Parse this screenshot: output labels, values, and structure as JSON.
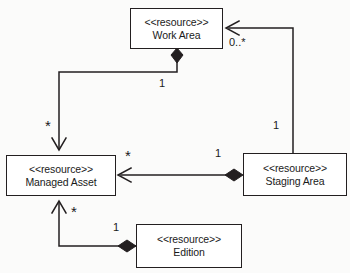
{
  "diagram": {
    "type": "uml-class-diagram",
    "background_color": "#fbfbfa",
    "line_color": "#231f20",
    "box_fill": "#ffffff",
    "classes": [
      {
        "id": "work-area",
        "stereotype": "<<resource>>",
        "name": "Work Area",
        "x": 130,
        "y": 8,
        "width": 93,
        "height": 41
      },
      {
        "id": "managed-asset",
        "stereotype": "<<resource>>",
        "name": "Managed Asset",
        "x": 6,
        "y": 155,
        "width": 110,
        "height": 41
      },
      {
        "id": "staging-area",
        "stereotype": "<<resource>>",
        "name": "Staging Area",
        "x": 243,
        "y": 153,
        "width": 104,
        "height": 43
      },
      {
        "id": "edition",
        "stereotype": "<<resource>>",
        "name": "Edition",
        "x": 136,
        "y": 224,
        "width": 106,
        "height": 44
      }
    ],
    "relationships": [
      {
        "id": "work-area-composes-managed-asset",
        "from": "work-area",
        "to": "managed-asset",
        "kind": "composition",
        "source_multiplicity": "1",
        "target_multiplicity": "*"
      },
      {
        "id": "staging-area-composes-managed-asset",
        "from": "staging-area",
        "to": "managed-asset",
        "kind": "composition",
        "source_multiplicity": "1",
        "target_multiplicity": "*"
      },
      {
        "id": "staging-area-references-work-area",
        "from": "staging-area",
        "to": "work-area",
        "kind": "association",
        "source_multiplicity": "1",
        "target_multiplicity": "0..*"
      },
      {
        "id": "edition-composes-managed-asset",
        "from": "edition",
        "to": "managed-asset",
        "kind": "composition",
        "source_multiplicity": "1",
        "target_multiplicity": "*"
      }
    ],
    "multiplicity_labels": [
      {
        "id": "work-area-end",
        "text": "1",
        "x": 159,
        "y": 78,
        "star": false
      },
      {
        "id": "work-area-target",
        "text": "*",
        "x": 45,
        "y": 118,
        "star": true
      },
      {
        "id": "staging-to-work-area",
        "text": "0..*",
        "x": 229,
        "y": 37,
        "star": false
      },
      {
        "id": "staging-vertical",
        "text": "1",
        "x": 273,
        "y": 120,
        "star": false
      },
      {
        "id": "staging-end",
        "text": "1",
        "x": 215,
        "y": 148,
        "star": false
      },
      {
        "id": "managed-asset-left",
        "text": "*",
        "x": 125,
        "y": 148,
        "star": true
      },
      {
        "id": "edition-target",
        "text": "*",
        "x": 71,
        "y": 204,
        "star": true
      },
      {
        "id": "edition-end",
        "text": "1",
        "x": 113,
        "y": 222,
        "star": false
      }
    ]
  }
}
